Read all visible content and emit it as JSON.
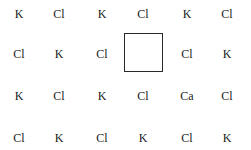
{
  "lattice": {
    "rows": [
      [
        "K",
        "Cl",
        "K",
        "Cl",
        "K",
        "Cl"
      ],
      [
        "Cl",
        "K",
        "Cl",
        "",
        "Cl",
        "K"
      ],
      [
        "K",
        "Cl",
        "K",
        "Cl",
        "Ca",
        "Cl"
      ],
      [
        "Cl",
        "K",
        "Cl",
        "K",
        "Cl",
        "K"
      ]
    ],
    "vacancy": {
      "row": 1,
      "col": 3
    }
  }
}
